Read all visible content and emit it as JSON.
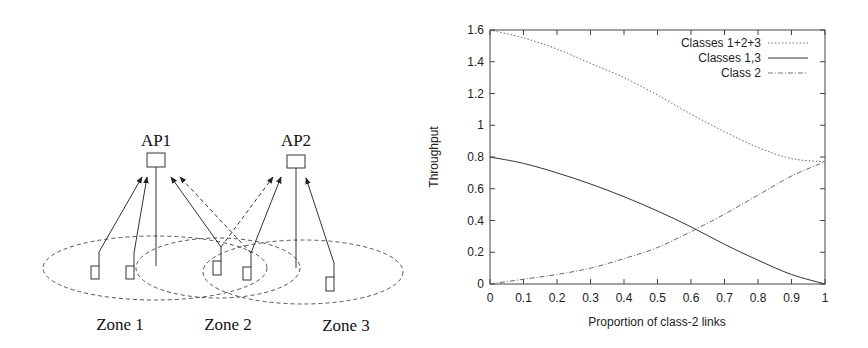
{
  "diagram": {
    "access_points": [
      {
        "label": "AP1",
        "x": 156,
        "y": 160
      },
      {
        "label": "AP2",
        "x": 296,
        "y": 161
      }
    ],
    "zones": [
      {
        "label": "Zone 1",
        "cx": 155,
        "cy": 268,
        "rx": 112,
        "ry": 32,
        "label_x": 120,
        "label_y": 330
      },
      {
        "label": "Zone 2",
        "cx": 218,
        "cy": 268,
        "rx": 82,
        "ry": 30,
        "label_x": 228,
        "label_y": 330
      },
      {
        "label": "Zone 3",
        "cx": 303,
        "cy": 272,
        "rx": 100,
        "ry": 32,
        "label_x": 346,
        "label_y": 331
      }
    ]
  },
  "chart_data": {
    "type": "line",
    "title": "",
    "xlabel": "Proportion of class-2 links",
    "ylabel": "Throughput",
    "xlim": [
      0,
      1
    ],
    "ylim": [
      0,
      1.6
    ],
    "xticks": [
      "0",
      "0.1",
      "0.2",
      "0.3",
      "0.4",
      "0.5",
      "0.6",
      "0.7",
      "0.8",
      "0.9",
      "1"
    ],
    "yticks": [
      "0",
      "0.2",
      "0.4",
      "0.6",
      "0.8",
      "1",
      "1.2",
      "1.4",
      "1.6"
    ],
    "grid": false,
    "legend_position": "top-right",
    "x": [
      0,
      0.1,
      0.2,
      0.3,
      0.4,
      0.5,
      0.6,
      0.7,
      0.8,
      0.9,
      1.0
    ],
    "series": [
      {
        "name": "Classes 1+2+3",
        "style": "dotted",
        "values": [
          1.6,
          1.55,
          1.48,
          1.39,
          1.3,
          1.19,
          1.07,
          0.96,
          0.86,
          0.79,
          0.77
        ]
      },
      {
        "name": "Classes 1,3",
        "style": "solid",
        "values": [
          0.8,
          0.76,
          0.7,
          0.63,
          0.55,
          0.46,
          0.36,
          0.25,
          0.15,
          0.06,
          0.0
        ]
      },
      {
        "name": "Class 2",
        "style": "dash-dot",
        "values": [
          0.0,
          0.03,
          0.06,
          0.1,
          0.16,
          0.23,
          0.33,
          0.44,
          0.56,
          0.68,
          0.77
        ]
      }
    ]
  }
}
